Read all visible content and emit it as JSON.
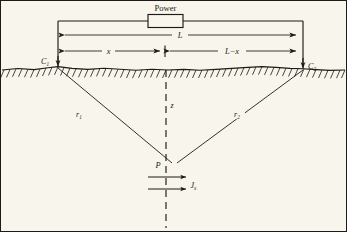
{
  "figure": {
    "background_color": "#f7f5ec",
    "ink_color": "#1d1b16",
    "width": 347,
    "height": 232
  },
  "circuit": {
    "power_label": "Power",
    "power_symbol": "resistor-box"
  },
  "dimensions": {
    "total_label": "L",
    "left_segment_label": "x",
    "right_segment_label": "L−x"
  },
  "electrodes": {
    "left": {
      "label": "C",
      "subscript": "1"
    },
    "right": {
      "label": "C",
      "subscript": "2"
    }
  },
  "subsurface": {
    "left_ray_label": "r",
    "left_ray_subscript": "1",
    "right_ray_label": "r",
    "right_ray_subscript": "2",
    "point_label": "P",
    "depth_axis_label": "z",
    "current_density_label": "J",
    "current_density_subscript": "x"
  },
  "icons": {
    "ground_hatch": "ground-hatching-icon",
    "arrow_left": "arrow-left-icon",
    "arrow_right": "arrow-right-icon",
    "arrow_down": "arrow-down-icon",
    "center_tick": "center-tick-icon"
  }
}
